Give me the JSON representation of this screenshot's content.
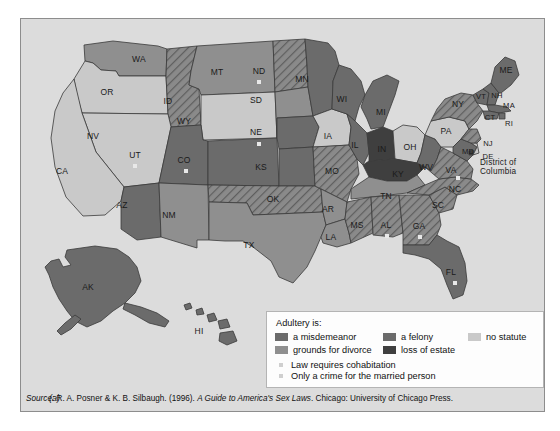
{
  "figure": {
    "sub_label": "(a)",
    "source_prefix": "Source:",
    "source_text": " R. A. Posner & K. B. Silbaugh. (1996). ",
    "source_title": "A Guide to America's Sex Laws",
    "source_suffix": ". Chicago: University of Chicago Press."
  },
  "legend": {
    "title": "Adultery is:",
    "items": [
      {
        "label": "a misdemeanor",
        "color": "#6b6b6b",
        "key": "misdemeanor"
      },
      {
        "label": "a felony",
        "color": "#6b6b6b",
        "key": "felony"
      },
      {
        "label": "no statute",
        "color": "#c9c9c9",
        "key": "no-statute"
      },
      {
        "label": "grounds for divorce",
        "color": "#8f8f8f",
        "key": "grounds-for-divorce"
      },
      {
        "label": "loss of estate",
        "color": "#3f3f3f",
        "key": "loss-of-estate"
      }
    ],
    "notes": [
      {
        "label": "Law requires cohabitation",
        "marker_color": "#cfcfcf"
      },
      {
        "label": "Only a crime for the married person",
        "marker_color": "#cfcfcf"
      }
    ]
  },
  "colors": {
    "panel_background": "#dcdcdc",
    "panel_border": "#8d8d8d",
    "state_stroke": "#3a3a3a",
    "misdemeanor": "#6b6b6b",
    "felony": "#6b6b6b",
    "no_statute": "#c9c9c9",
    "grounds_for_divorce": "#8f8f8f",
    "loss_of_estate": "#3f3f3f",
    "hatch_fill": "#909090",
    "marker": "#e8e8e8"
  },
  "chart_data": {
    "type": "map",
    "title": "Adultery is:",
    "region": "United States",
    "categories": [
      "a misdemeanor",
      "a felony",
      "no statute",
      "grounds for divorce",
      "loss of estate"
    ],
    "annotations": [
      "Law requires cohabitation",
      "Only a crime for the married person"
    ],
    "states": [
      {
        "code": "WA",
        "category": "grounds for divorce",
        "hatched": false,
        "marker": false
      },
      {
        "code": "OR",
        "category": "no statute",
        "hatched": false,
        "marker": false
      },
      {
        "code": "ID",
        "category": "felony",
        "hatched": true,
        "marker": false
      },
      {
        "code": "MT",
        "category": "grounds for divorce",
        "hatched": false,
        "marker": false
      },
      {
        "code": "WY",
        "category": "no statute",
        "hatched": false,
        "marker": false
      },
      {
        "code": "NV",
        "category": "no statute",
        "hatched": false,
        "marker": false
      },
      {
        "code": "UT",
        "category": "a misdemeanor",
        "hatched": false,
        "marker": true
      },
      {
        "code": "CA",
        "category": "no statute",
        "hatched": false,
        "marker": false
      },
      {
        "code": "CO",
        "category": "a misdemeanor",
        "hatched": false,
        "marker": true
      },
      {
        "code": "AZ",
        "category": "a misdemeanor",
        "hatched": false,
        "marker": false
      },
      {
        "code": "NM",
        "category": "grounds for divorce",
        "hatched": false,
        "marker": false
      },
      {
        "code": "ND",
        "category": "a misdemeanor",
        "hatched": true,
        "marker": true
      },
      {
        "code": "SD",
        "category": "grounds for divorce",
        "hatched": false,
        "marker": false
      },
      {
        "code": "NE",
        "category": "a misdemeanor",
        "hatched": false,
        "marker": true
      },
      {
        "code": "KS",
        "category": "a misdemeanor",
        "hatched": false,
        "marker": false
      },
      {
        "code": "OK",
        "category": "a felony",
        "hatched": true,
        "marker": false
      },
      {
        "code": "TX",
        "category": "grounds for divorce",
        "hatched": false,
        "marker": false
      },
      {
        "code": "MN",
        "category": "a misdemeanor",
        "hatched": false,
        "marker": false
      },
      {
        "code": "IA",
        "category": "no statute",
        "hatched": false,
        "marker": false
      },
      {
        "code": "MO",
        "category": "a felony",
        "hatched": true,
        "marker": false
      },
      {
        "code": "AR",
        "category": "grounds for divorce",
        "hatched": false,
        "marker": false
      },
      {
        "code": "LA",
        "category": "grounds for divorce",
        "hatched": false,
        "marker": false
      },
      {
        "code": "WI",
        "category": "a misdemeanor",
        "hatched": false,
        "marker": false
      },
      {
        "code": "IL",
        "category": "a misdemeanor",
        "hatched": false,
        "marker": false
      },
      {
        "code": "MI",
        "category": "a misdemeanor",
        "hatched": false,
        "marker": false
      },
      {
        "code": "IN",
        "category": "loss of estate",
        "hatched": false,
        "marker": false
      },
      {
        "code": "OH",
        "category": "no statute",
        "hatched": false,
        "marker": false
      },
      {
        "code": "KY",
        "category": "loss of estate",
        "hatched": false,
        "marker": false
      },
      {
        "code": "TN",
        "category": "grounds for divorce",
        "hatched": false,
        "marker": false
      },
      {
        "code": "MS",
        "category": "a misdemeanor",
        "hatched": true,
        "marker": false
      },
      {
        "code": "AL",
        "category": "a misdemeanor",
        "hatched": true,
        "marker": true
      },
      {
        "code": "GA",
        "category": "a misdemeanor",
        "hatched": true,
        "marker": true
      },
      {
        "code": "FL",
        "category": "a misdemeanor",
        "hatched": false,
        "marker": true
      },
      {
        "code": "SC",
        "category": "a misdemeanor",
        "hatched": true,
        "marker": false
      },
      {
        "code": "NC",
        "category": "a misdemeanor",
        "hatched": true,
        "marker": false
      },
      {
        "code": "WV",
        "category": "a misdemeanor",
        "hatched": false,
        "marker": false
      },
      {
        "code": "VA",
        "category": "a misdemeanor",
        "hatched": true,
        "marker": true
      },
      {
        "code": "MD",
        "category": "a misdemeanor",
        "hatched": false,
        "marker": false
      },
      {
        "code": "DE",
        "category": "no statute",
        "hatched": false,
        "marker": false
      },
      {
        "code": "District of Columbia",
        "category": "a misdemeanor",
        "hatched": false,
        "marker": false
      },
      {
        "code": "PA",
        "category": "no statute",
        "hatched": false,
        "marker": false
      },
      {
        "code": "NJ",
        "category": "a misdemeanor",
        "hatched": true,
        "marker": false
      },
      {
        "code": "NY",
        "category": "a misdemeanor",
        "hatched": true,
        "marker": false
      },
      {
        "code": "CT",
        "category": "a misdemeanor",
        "hatched": false,
        "marker": false
      },
      {
        "code": "RI",
        "category": "a misdemeanor",
        "hatched": false,
        "marker": false
      },
      {
        "code": "MA",
        "category": "a misdemeanor",
        "hatched": false,
        "marker": false
      },
      {
        "code": "VT",
        "category": "a misdemeanor",
        "hatched": false,
        "marker": false
      },
      {
        "code": "NH",
        "category": "a misdemeanor",
        "hatched": false,
        "marker": false
      },
      {
        "code": "ME",
        "category": "a misdemeanor",
        "hatched": false,
        "marker": false
      },
      {
        "code": "AK",
        "category": "a misdemeanor",
        "hatched": false,
        "marker": false
      },
      {
        "code": "HI",
        "category": "a misdemeanor",
        "hatched": false,
        "marker": false
      }
    ]
  },
  "map_labels": [
    {
      "code": "WA",
      "x": 118,
      "y": 40
    },
    {
      "code": "OR",
      "x": 86,
      "y": 73
    },
    {
      "code": "ID",
      "x": 147,
      "y": 82
    },
    {
      "code": "MT",
      "x": 196,
      "y": 53
    },
    {
      "code": "WY",
      "x": 163,
      "y": 102
    },
    {
      "code": "NV",
      "x": 72,
      "y": 117
    },
    {
      "code": "UT",
      "x": 114,
      "y": 136
    },
    {
      "code": "CA",
      "x": 41,
      "y": 152
    },
    {
      "code": "CO",
      "x": 163,
      "y": 141
    },
    {
      "code": "AZ",
      "x": 101,
      "y": 186
    },
    {
      "code": "NM",
      "x": 148,
      "y": 196
    },
    {
      "code": "ND",
      "x": 238,
      "y": 52
    },
    {
      "code": "SD",
      "x": 235,
      "y": 81
    },
    {
      "code": "NE",
      "x": 235,
      "y": 113
    },
    {
      "code": "KS",
      "x": 240,
      "y": 148
    },
    {
      "code": "OK",
      "x": 252,
      "y": 180
    },
    {
      "code": "TX",
      "x": 228,
      "y": 226
    },
    {
      "code": "MN",
      "x": 281,
      "y": 60
    },
    {
      "code": "IA",
      "x": 307,
      "y": 117
    },
    {
      "code": "MO",
      "x": 311,
      "y": 152
    },
    {
      "code": "AR",
      "x": 307,
      "y": 190
    },
    {
      "code": "LA",
      "x": 310,
      "y": 218
    },
    {
      "code": "MS",
      "x": 336,
      "y": 206
    },
    {
      "code": "AL",
      "x": 365,
      "y": 206
    },
    {
      "code": "GA",
      "x": 398,
      "y": 207
    },
    {
      "code": "FL",
      "x": 430,
      "y": 253
    },
    {
      "code": "SC",
      "x": 417,
      "y": 186
    },
    {
      "code": "NC",
      "x": 434,
      "y": 170
    },
    {
      "code": "TN",
      "x": 365,
      "y": 177
    },
    {
      "code": "KY",
      "x": 377,
      "y": 155
    },
    {
      "code": "IL",
      "x": 334,
      "y": 126
    },
    {
      "code": "IN",
      "x": 361,
      "y": 130
    },
    {
      "code": "OH",
      "x": 389,
      "y": 128
    },
    {
      "code": "WI",
      "x": 321,
      "y": 80
    },
    {
      "code": "MI",
      "x": 360,
      "y": 93
    },
    {
      "code": "WV",
      "x": 405,
      "y": 148
    },
    {
      "code": "VA",
      "x": 430,
      "y": 151
    },
    {
      "code": "PA",
      "x": 425,
      "y": 112
    },
    {
      "code": "NY",
      "x": 437,
      "y": 85
    },
    {
      "code": "VT",
      "x": 460,
      "y": 77
    },
    {
      "code": "NH",
      "x": 476,
      "y": 76
    },
    {
      "code": "ME",
      "x": 485,
      "y": 51
    },
    {
      "code": "MA",
      "x": 488,
      "y": 86
    },
    {
      "code": "CT",
      "x": 469,
      "y": 98
    },
    {
      "code": "RI",
      "x": 488,
      "y": 104
    },
    {
      "code": "NJ",
      "x": 467,
      "y": 124
    },
    {
      "code": "DE",
      "x": 467,
      "y": 137
    },
    {
      "code": "MD",
      "x": 447,
      "y": 132
    },
    {
      "code": "AK",
      "x": 67,
      "y": 268
    },
    {
      "code": "HI",
      "x": 178,
      "y": 312
    }
  ],
  "dc_label": {
    "line1": "District of",
    "line2": "Columbia",
    "x": 459,
    "y": 148
  },
  "map_markers": [
    {
      "code": "UT",
      "x": 114,
      "y": 147
    },
    {
      "code": "CO",
      "x": 165,
      "y": 152
    },
    {
      "code": "ND",
      "x": 238,
      "y": 63
    },
    {
      "code": "NE",
      "x": 238,
      "y": 125
    },
    {
      "code": "AL",
      "x": 366,
      "y": 217
    },
    {
      "code": "GA",
      "x": 399,
      "y": 218
    },
    {
      "code": "FL",
      "x": 434,
      "y": 264
    },
    {
      "code": "VA",
      "x": 437,
      "y": 159
    }
  ]
}
